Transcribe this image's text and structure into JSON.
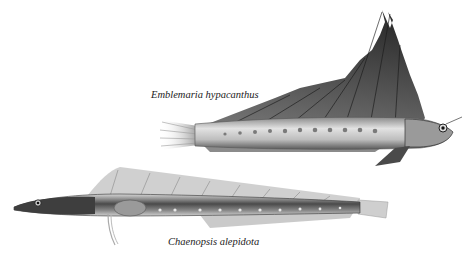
{
  "plate": {
    "species": [
      {
        "name": "Emblemaria hypacanthus",
        "description": "Illustration of a blenny with a tall sail-like dorsal fin, facing right"
      },
      {
        "name": "Chaenopsis alepidota",
        "description": "Illustration of an elongated pikeblenny, facing left"
      }
    ],
    "colors": {
      "background": "#ffffff",
      "body_light": "#cfcfcf",
      "body_dark": "#3a3a3a",
      "fin_dark": "#2e2e2e"
    }
  }
}
